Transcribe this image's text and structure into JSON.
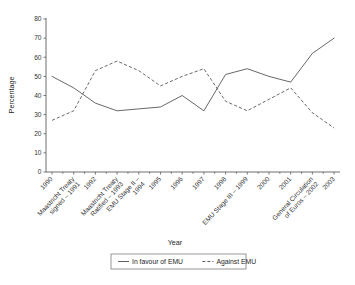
{
  "chart_data": {
    "type": "line",
    "title": "",
    "xlabel": "Year",
    "ylabel": "Percentage",
    "ylim": [
      0,
      80
    ],
    "ytick_step": 10,
    "yticks": [
      0,
      10,
      20,
      30,
      40,
      50,
      60,
      70,
      80
    ],
    "grid": false,
    "legend_position": "bottom",
    "categories": [
      "1990",
      "Maastricht Treaty signed – 1991",
      "1992",
      "Maastricht Treaty Ratified – 1993",
      "EMU Stage II – 1994",
      "1995",
      "1996",
      "1997",
      "1998",
      "EMU Stage III – 1999",
      "2000",
      "2001",
      "General Circulation of Euros – 2002",
      "2003"
    ],
    "category_lines": [
      [
        "1990"
      ],
      [
        "Maastricht Treaty",
        "signed – 1991"
      ],
      [
        "1992"
      ],
      [
        "Maastricht Treaty",
        "Ratified – 1993"
      ],
      [
        "EMU Stage II –",
        "1994"
      ],
      [
        "1995"
      ],
      [
        "1996"
      ],
      [
        "1997"
      ],
      [
        "1998"
      ],
      [
        "EMU Stage III – 1999"
      ],
      [
        "2000"
      ],
      [
        "2001"
      ],
      [
        "General Circulation",
        "of Euros – 2002"
      ],
      [
        "2003"
      ]
    ],
    "series": [
      {
        "name": "In favour of EMU",
        "style": "solid",
        "values": [
          50,
          44,
          36,
          32,
          33,
          34,
          40,
          32,
          51,
          54,
          50,
          47,
          62,
          70
        ]
      },
      {
        "name": "Against EMU",
        "style": "dashed",
        "values": [
          27,
          32,
          53,
          58,
          53,
          45,
          50,
          54,
          37,
          32,
          38,
          44,
          31,
          23
        ]
      }
    ]
  },
  "axes": {
    "y_title": "Percentage",
    "x_title": "Year"
  },
  "legend": {
    "entries": [
      {
        "label": "In favour of EMU",
        "style": "solid"
      },
      {
        "label": "Against EMU",
        "style": "dashed"
      }
    ]
  }
}
